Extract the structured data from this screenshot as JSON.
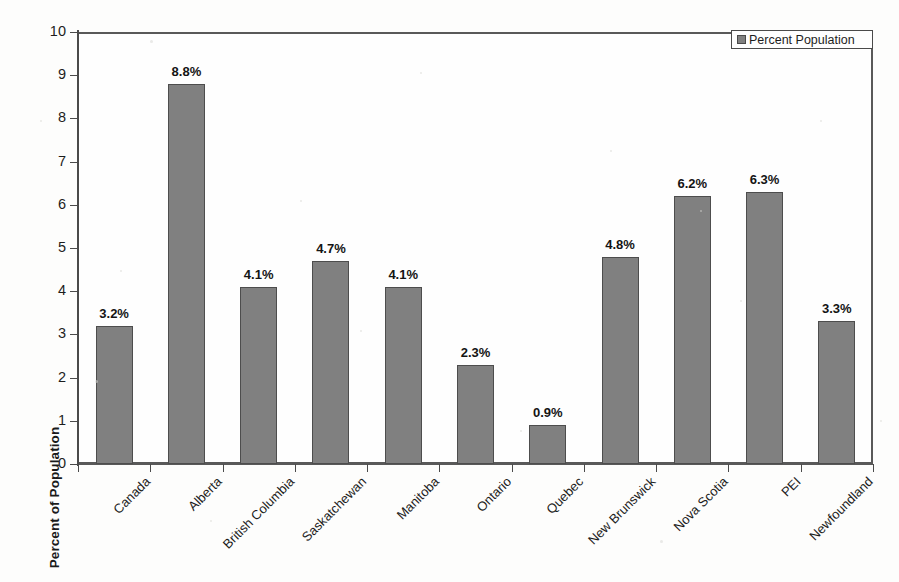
{
  "chart_data": {
    "type": "bar",
    "title": "",
    "xlabel": "",
    "ylabel": "Percent of Population",
    "ylim": [
      0,
      10
    ],
    "ytick_labels": [
      "10",
      "9",
      "8",
      "7",
      "6",
      "5",
      "4",
      "3",
      "2",
      "1",
      "0"
    ],
    "ytick_values": [
      10,
      9,
      8,
      7,
      6,
      5,
      4,
      3,
      2,
      1,
      0
    ],
    "grid": true,
    "legend_position": "top-right",
    "categories": [
      "Canada",
      "Alberta",
      "British Columbia",
      "Saskatchewan",
      "Manitoba",
      "Ontario",
      "Quebec",
      "New Brunswick",
      "Nova Scotia",
      "PEI",
      "Newfoundland"
    ],
    "values": [
      3.2,
      8.8,
      4.1,
      4.7,
      4.1,
      2.3,
      0.9,
      4.8,
      6.2,
      6.3,
      3.3
    ],
    "data_labels": [
      "3.2%",
      "8.8%",
      "4.1%",
      "4.7%",
      "4.1%",
      "2.3%",
      "0.9%",
      "4.8%",
      "6.2%",
      "6.3%",
      "3.3%"
    ],
    "series": [
      {
        "name": "Percent Population",
        "values": [
          3.2,
          8.8,
          4.1,
          4.7,
          4.1,
          2.3,
          0.9,
          4.8,
          6.2,
          6.3,
          3.3
        ],
        "color": "#808080"
      }
    ]
  },
  "legend": {
    "entries": [
      {
        "label": "Percent Population",
        "color": "#808080"
      }
    ]
  },
  "colors": {
    "bar_fill": "#808080",
    "bar_outline": "#4d4d4d",
    "gridline": "#b9b9b9",
    "axis": "#4a4a4a",
    "background": "#fdfdfc",
    "text": "#1d1d1d"
  }
}
